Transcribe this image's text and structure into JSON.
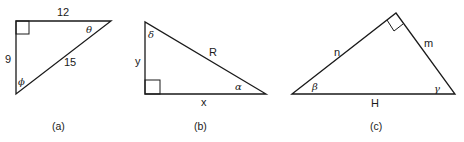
{
  "figures": [
    {
      "id": "a",
      "caption": "(a)",
      "sides": {
        "top": "12",
        "left": "9",
        "hypotenuse": "15"
      },
      "angles": {
        "right_vertex": "θ",
        "bottom_vertex": "ϕ"
      },
      "right_angle_at": "top-left"
    },
    {
      "id": "b",
      "caption": "(b)",
      "sides": {
        "left": "y",
        "bottom": "x",
        "hypotenuse": "R"
      },
      "angles": {
        "top_vertex": "δ",
        "right_vertex": "α"
      },
      "right_angle_at": "bottom-left"
    },
    {
      "id": "c",
      "caption": "(c)",
      "sides": {
        "left": "n",
        "right": "m",
        "base": "H"
      },
      "angles": {
        "left_vertex": "β",
        "right_vertex": "γ"
      },
      "right_angle_at": "apex"
    }
  ]
}
